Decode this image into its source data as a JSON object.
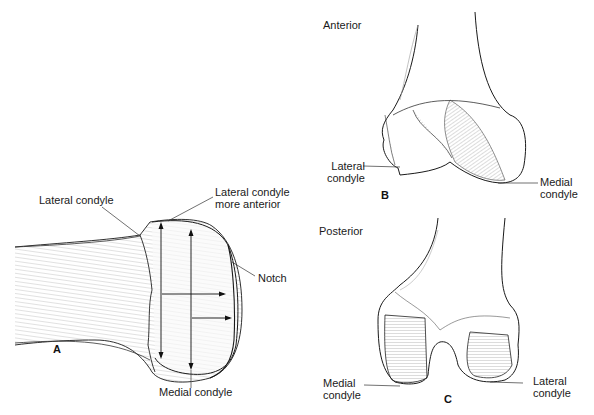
{
  "figure": {
    "panels": [
      {
        "id": "A",
        "letter": "A",
        "view": "",
        "labels": {
          "lateral_condyle": "Lateral condyle",
          "lateral_condyle_more_anterior": "Lateral condyle\nmore anterior",
          "notch": "Notch",
          "medial_condyle": "Medial condyle"
        }
      },
      {
        "id": "B",
        "letter": "B",
        "view": "Anterior",
        "labels": {
          "lateral_condyle": "Lateral\ncondyle",
          "medial_condyle": "Medial\ncondyle"
        }
      },
      {
        "id": "C",
        "letter": "C",
        "view": "Posterior",
        "labels": {
          "medial_condyle": "Medial\ncondyle",
          "lateral_condyle": "Lateral\ncondyle"
        }
      }
    ]
  },
  "colors": {
    "ink": "#1a1a1a",
    "background": "#ffffff",
    "hatch": "#777777"
  }
}
